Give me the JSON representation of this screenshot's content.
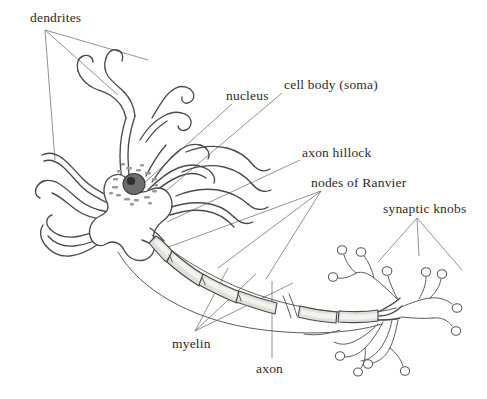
{
  "figure": {
    "background_color": "#ffffff",
    "line_color": "#4a4a4a",
    "leader_color": "#6e6e6e",
    "text_color": "#2b2b2b",
    "myelin_fill": "#dfe0da",
    "nucleus_fill": "#6d6d6d"
  },
  "labels": {
    "dendrites": "dendrites",
    "nucleus": "nucleus",
    "cell_body": "cell body (soma)",
    "axon_hillock": "axon hillock",
    "nodes_of_ranvier": "nodes of Ranvier",
    "synaptic_knobs": "synaptic knobs",
    "myelin": "myelin",
    "axon": "axon"
  },
  "parts": [
    {
      "name": "dendrites",
      "label": "dendrites",
      "leader_count": 3
    },
    {
      "name": "nucleus",
      "label": "nucleus",
      "leader_count": 1
    },
    {
      "name": "cell-body",
      "label": "cell body (soma)",
      "leader_count": 1
    },
    {
      "name": "axon-hillock",
      "label": "axon hillock",
      "leader_count": 1
    },
    {
      "name": "nodes-of-ranvier",
      "label": "nodes of Ranvier",
      "leader_count": 3
    },
    {
      "name": "synaptic-knobs",
      "label": "synaptic knobs",
      "leader_count": 3
    },
    {
      "name": "myelin",
      "label": "myelin",
      "leader_count": 3
    },
    {
      "name": "axon",
      "label": "axon",
      "leader_count": 1
    }
  ]
}
